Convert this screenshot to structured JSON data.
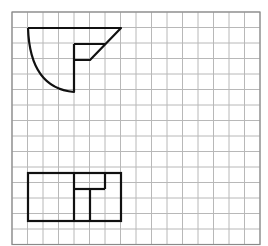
{
  "canvas": {
    "width": 268,
    "height": 246,
    "background": "#ffffff"
  },
  "grid": {
    "origin_x": 12,
    "origin_y": 12,
    "cell": 15.5,
    "cols": 16,
    "rows": 15,
    "line_color": "#b8b8b8",
    "border_color": "#8a8a8a"
  },
  "shapes": {
    "stroke_color": "#111111",
    "stroke_width": 2.2,
    "top_figure": {
      "description": "Quarter-circle arc with rectangle notch and diagonal triangle (top view)",
      "path": "M28 28 L121 28 L90 60 L74 60 M74 44 L105 44 M28 28 Q30 88 74 92 L74 44"
    },
    "bottom_figure": {
      "description": "Rectangle divided into sections (front view)",
      "outer": {
        "x": 28,
        "y": 173,
        "w": 93,
        "h": 48
      },
      "lines": [
        {
          "x1": 74,
          "y1": 173,
          "x2": 74,
          "y2": 221
        },
        {
          "x1": 74,
          "y1": 189,
          "x2": 105,
          "y2": 189
        },
        {
          "x1": 105,
          "y1": 173,
          "x2": 105,
          "y2": 189
        },
        {
          "x1": 90,
          "y1": 189,
          "x2": 90,
          "y2": 221
        }
      ]
    }
  }
}
